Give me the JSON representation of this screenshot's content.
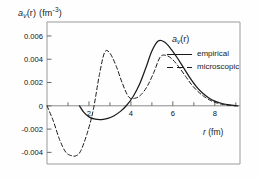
{
  "figure": {
    "name": "pairing-field-radial-profile",
    "background": "#fefefe",
    "ylabel_main": "a",
    "ylabel_sub": "v",
    "ylabel_arg": "(r)",
    "ylabel_unit_open": "(fm",
    "ylabel_unit_sup": "-3",
    "ylabel_unit_close": ")",
    "xlabel_main": "r",
    "xlabel_unit_open": "(fm",
    "xlabel_unit_close": ")"
  },
  "legend": {
    "title_main": "a",
    "title_sub": "v",
    "title_arg": "(r)",
    "empirical_label": "empirical",
    "microscopic_label": "microscopic",
    "empirical_style": "solid",
    "microscopic_style": "dashed",
    "position": "upper-right"
  },
  "chart_data": {
    "type": "line",
    "title": "",
    "subtitle": "",
    "xlabel": "r (fm)",
    "ylabel": "a_v(r) (fm^-3)",
    "xlim": [
      0,
      9.2
    ],
    "ylim": [
      -0.005,
      0.0072
    ],
    "grid": false,
    "legend_position": "upper-right",
    "xticks_major": [
      2,
      4,
      6,
      8
    ],
    "xticks_major_labels": [
      "2",
      "4",
      "6",
      "8"
    ],
    "xticks_minor": [
      1,
      3,
      5,
      7,
      9
    ],
    "yticks": [
      0.006,
      0.004,
      0.002,
      0,
      -0.002,
      -0.004
    ],
    "yticks_labels": [
      "0.006",
      "0.004",
      "0.002",
      "0",
      "-0.002",
      "-0.004"
    ],
    "zero_line": 0,
    "series": [
      {
        "name": "empirical",
        "style": "solid",
        "color": "#1a1a1a",
        "x": [
          1.55,
          1.75,
          2.0,
          2.3,
          2.6,
          2.9,
          3.2,
          3.5,
          3.8,
          4.1,
          4.4,
          4.7,
          5.0,
          5.3,
          5.6,
          5.9,
          6.2,
          6.5,
          6.8,
          7.1,
          7.4,
          7.7,
          8.0,
          8.3,
          8.6,
          8.9,
          9.1
        ],
        "y": [
          0.0,
          -0.00055,
          -0.00095,
          -0.00115,
          -0.00118,
          -0.00108,
          -0.00085,
          -0.00048,
          5e-05,
          0.00078,
          0.0018,
          0.0032,
          0.0047,
          0.00556,
          0.00548,
          0.0049,
          0.00415,
          0.0033,
          0.00245,
          0.0017,
          0.00112,
          0.0007,
          0.0004,
          0.00022,
          0.0001,
          3e-05,
          0.0
        ]
      },
      {
        "name": "microscopic",
        "style": "dashed",
        "color": "#1a1a1a",
        "x": [
          0.0,
          0.3,
          0.6,
          0.9,
          1.2,
          1.4,
          1.6,
          1.9,
          2.2,
          2.5,
          2.75,
          3.0,
          3.3,
          3.6,
          3.9,
          4.2,
          4.5,
          4.8,
          5.1,
          5.4,
          5.7,
          6.0,
          6.3,
          6.6,
          6.9,
          7.2,
          7.5,
          7.8,
          8.1,
          8.4,
          8.7,
          9.0
        ],
        "y": [
          0.0,
          -0.0013,
          -0.0029,
          -0.004,
          -0.0043,
          -0.00428,
          -0.0039,
          -0.00245,
          -0.0004,
          0.0027,
          0.0046,
          0.00452,
          0.0034,
          0.0019,
          0.00075,
          0.00065,
          0.00098,
          0.00175,
          0.0029,
          0.0042,
          0.00432,
          0.00395,
          0.0033,
          0.00255,
          0.0018,
          0.00122,
          0.00078,
          0.00045,
          0.00024,
          0.00011,
          3e-05,
          0.0
        ]
      }
    ],
    "annotations": [
      {
        "text": "peak empirical ~0.0056 at r~5.3"
      },
      {
        "text": "peak microscopic ~0.0046 at r~2.75"
      },
      {
        "text": "minimum microscopic ~-0.0043 at r~1.3"
      }
    ]
  }
}
